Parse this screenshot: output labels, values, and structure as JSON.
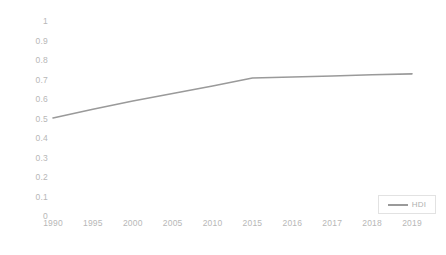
{
  "chart_data": {
    "type": "line",
    "title": "",
    "xlabel": "",
    "ylabel": "",
    "categories": [
      "1990",
      "1995",
      "2000",
      "2005",
      "2010",
      "2015",
      "2016",
      "2017",
      "2018",
      "2019"
    ],
    "series": [
      {
        "name": "HDI",
        "color": "#9a9a9a",
        "values": [
          0.503,
          0.547,
          0.59,
          0.628,
          0.667,
          0.708,
          0.713,
          0.718,
          0.724,
          0.729
        ]
      }
    ],
    "ylim": [
      0,
      1
    ],
    "ytick_labels": [
      "1",
      "0.9",
      "0.8",
      "0.7",
      "0.6",
      "0.5",
      "0.4",
      "0.3",
      "0.2",
      "0.1",
      "0"
    ],
    "ytick_values": [
      1,
      0.9,
      0.8,
      0.7,
      0.6,
      0.5,
      0.4,
      0.3,
      0.2,
      0.1,
      0
    ],
    "grid": false,
    "axis_line": false,
    "legend": {
      "position": "bottom-right",
      "entries": [
        "HDI"
      ]
    },
    "colors": {
      "line": "#9a9a9a",
      "tick_label": "#b7b7b7",
      "legend_label": "#b0b0b0",
      "legend_border": "#e2e2e2",
      "background": "#ffffff"
    }
  }
}
